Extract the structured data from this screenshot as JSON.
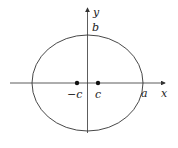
{
  "diagram": {
    "type": "ellipse-with-foci",
    "axes": {
      "x_label": "x",
      "y_label": "y"
    },
    "labels": {
      "semi_major": "a",
      "semi_minor": "b",
      "focus_left": "−c",
      "focus_right": "c"
    },
    "colors": {
      "stroke": "#333333",
      "point": "#111111"
    }
  }
}
